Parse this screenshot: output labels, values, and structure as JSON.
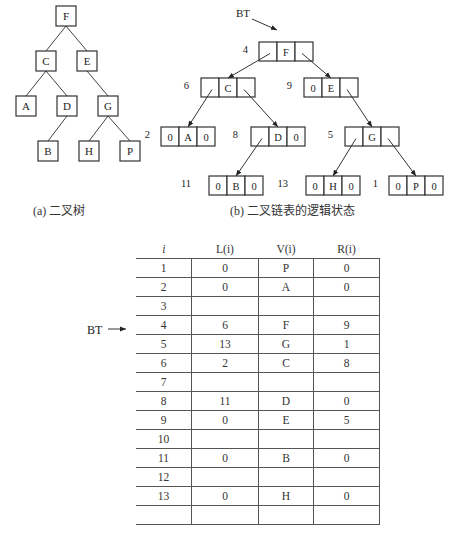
{
  "tree": {
    "caption": "(a) 二叉树",
    "nodes": [
      {
        "id": "F",
        "x": 66,
        "y": 16
      },
      {
        "id": "C",
        "x": 46,
        "y": 61
      },
      {
        "id": "E",
        "x": 87,
        "y": 61
      },
      {
        "id": "A",
        "x": 26,
        "y": 106
      },
      {
        "id": "D",
        "x": 67,
        "y": 106
      },
      {
        "id": "G",
        "x": 108,
        "y": 106
      },
      {
        "id": "B",
        "x": 48,
        "y": 151
      },
      {
        "id": "H",
        "x": 89,
        "y": 151
      },
      {
        "id": "P",
        "x": 130,
        "y": 151
      }
    ]
  },
  "linked": {
    "caption": "(b) 二叉链表的逻辑状态",
    "bt_label": "BT",
    "nodes": [
      {
        "idx": "4",
        "l": "",
        "v": "F",
        "r": ""
      },
      {
        "idx": "6",
        "l": "",
        "v": "C",
        "r": ""
      },
      {
        "idx": "9",
        "l": "0",
        "v": "E",
        "r": ""
      },
      {
        "idx": "2",
        "l": "0",
        "v": "A",
        "r": "0"
      },
      {
        "idx": "8",
        "l": "",
        "v": "D",
        "r": "0"
      },
      {
        "idx": "5",
        "l": "",
        "v": "G",
        "r": ""
      },
      {
        "idx": "11",
        "l": "0",
        "v": "B",
        "r": "0"
      },
      {
        "idx": "13",
        "l": "0",
        "v": "H",
        "r": "0"
      },
      {
        "idx": "1",
        "l": "0",
        "v": "P",
        "r": "0"
      }
    ]
  },
  "table": {
    "bt_label": "BT",
    "headers": [
      "i",
      "L(i)",
      "V(i)",
      "R(i)"
    ],
    "rows": [
      [
        "1",
        "0",
        "P",
        "0"
      ],
      [
        "2",
        "0",
        "A",
        "0"
      ],
      [
        "3",
        "",
        "",
        ""
      ],
      [
        "4",
        "6",
        "F",
        "9"
      ],
      [
        "5",
        "13",
        "G",
        "1"
      ],
      [
        "6",
        "2",
        "C",
        "8"
      ],
      [
        "7",
        "",
        "",
        ""
      ],
      [
        "8",
        "11",
        "D",
        "0"
      ],
      [
        "9",
        "0",
        "E",
        "5"
      ],
      [
        "10",
        "",
        "",
        ""
      ],
      [
        "11",
        "0",
        "B",
        "0"
      ],
      [
        "12",
        "",
        "",
        ""
      ],
      [
        "13",
        "0",
        "H",
        "0"
      ],
      [
        "",
        "",
        "",
        ""
      ]
    ]
  }
}
